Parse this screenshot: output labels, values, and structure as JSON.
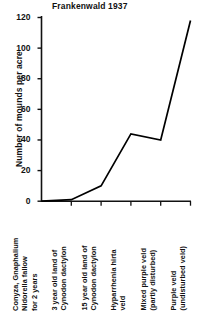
{
  "chart_data": {
    "type": "line",
    "title": "Frankenwald 1937",
    "xlabel": "",
    "ylabel": "Number of mounds per acre",
    "ylim": [
      0,
      120
    ],
    "yticks": [
      0,
      20,
      40,
      60,
      80,
      100,
      120
    ],
    "ytick_labels": [
      "0",
      "20",
      "40",
      "60",
      "80",
      "100",
      "120"
    ],
    "grid": false,
    "legend": null,
    "categories": [
      "Conyza, Gnaphalium Nidorella fallow for 2 years",
      "3 year old land of Cynodon dactylon",
      "15 year old land of Cynodon dactylon",
      "Hyparrhenia hirta veld",
      "Mixed purple veld (partly disturbed)",
      "Purple veld (undisturbed veld)"
    ],
    "category_lines": [
      [
        "Conyza, Gnaphalium",
        "Nidorella fallow",
        "for 2 years"
      ],
      [
        "3 year old land of",
        "Cynodon dactylon"
      ],
      [
        "15 year old land of",
        "Cynodon dactylon"
      ],
      [
        "Hyparrhenia hirta",
        "veld"
      ],
      [
        "Mixed purple veld",
        "(partly disturbed)"
      ],
      [
        "Purple veld",
        "(undisturbed veld)"
      ]
    ],
    "values": [
      0,
      1,
      10,
      44,
      40,
      118
    ],
    "series_color": "#000000"
  }
}
